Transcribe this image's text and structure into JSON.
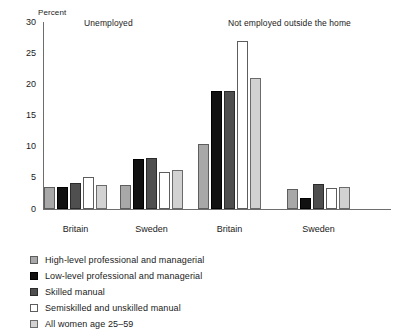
{
  "chart_data": {
    "type": "bar",
    "title": "",
    "xlabel": "",
    "ylabel": "Percent",
    "ylim": [
      0,
      30
    ],
    "yticks": [
      0,
      5,
      10,
      15,
      20,
      25,
      30
    ],
    "grid": false,
    "legend_position": "below-left",
    "panels": [
      {
        "title": "Unemployed"
      },
      {
        "title": "Not employed outside the home"
      }
    ],
    "categories": [
      "Britain",
      "Sweden",
      "Britain",
      "Sweden"
    ],
    "category_panels": [
      0,
      0,
      1,
      1
    ],
    "series": [
      {
        "name": "High-level professional and managerial",
        "color": "#a8a8a8",
        "values": [
          3.5,
          3.8,
          10.5,
          3.2
        ]
      },
      {
        "name": "Low-level professional and managerial",
        "color": "#111111",
        "values": [
          3.5,
          8.0,
          19.0,
          1.7
        ]
      },
      {
        "name": "Skilled manual",
        "color": "#4f4f4f",
        "values": [
          4.2,
          8.2,
          19.0,
          4.0
        ]
      },
      {
        "name": "Semiskilled and unskilled manual",
        "color": "#ffffff",
        "values": [
          5.2,
          6.0,
          27.0,
          3.3
        ]
      },
      {
        "name": "All women age 25–59",
        "color": "#d2d2d2",
        "values": [
          3.8,
          6.2,
          21.0,
          3.5
        ]
      }
    ]
  },
  "axis": {
    "y_label": "Percent",
    "ticks": [
      "30",
      "25",
      "20",
      "15",
      "10",
      "5",
      "0"
    ]
  },
  "panels": {
    "unemployed": "Unemployed",
    "not_employed": "Not employed outside the home"
  },
  "groups": [
    {
      "label": "Britain"
    },
    {
      "label": "Sweden"
    },
    {
      "label": "Britain"
    },
    {
      "label": "Sweden"
    }
  ],
  "legend": {
    "items": [
      {
        "label": "High-level professional and managerial",
        "swatch": "legend-swatch-high-level"
      },
      {
        "label": "Low-level professional and managerial",
        "swatch": "legend-swatch-low-level"
      },
      {
        "label": "Skilled manual",
        "swatch": "legend-swatch-skilled"
      },
      {
        "label": "Semiskilled and unskilled manual",
        "swatch": "legend-swatch-semiskilled"
      },
      {
        "label": "All women age 25–59",
        "swatch": "legend-swatch-all-women"
      }
    ]
  }
}
